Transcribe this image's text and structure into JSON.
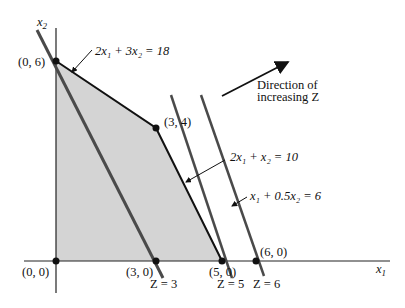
{
  "axes": {
    "x_label": "x",
    "x_sub": "1",
    "y_label": "x",
    "y_sub": "2"
  },
  "points": [
    {
      "label": "(0, 0)",
      "x": 0,
      "y": 0
    },
    {
      "label": "(0, 6)",
      "x": 0,
      "y": 6
    },
    {
      "label": "(3, 4)",
      "x": 3,
      "y": 4
    },
    {
      "label": "(3, 0)",
      "x": 3,
      "y": 0
    },
    {
      "label": "(5, 0)",
      "x": 5,
      "y": 0
    },
    {
      "label": "(6, 0)",
      "x": 6,
      "y": 0
    }
  ],
  "constraints": [
    {
      "label": "2x₁ + 3x₂ = 18"
    },
    {
      "label": "2x₁ + x₂ = 10"
    },
    {
      "label": "x₁ + 0.5x₂ = 6"
    }
  ],
  "objective_lines": [
    {
      "label": "Z = 3"
    },
    {
      "label": "Z = 5"
    },
    {
      "label": "Z = 6"
    }
  ],
  "direction": {
    "line1": "Direction of",
    "line2": "increasing Z"
  },
  "colors": {
    "feasible_fill": "#d4d4d4",
    "boundary": "#111111",
    "objective_line": "#4a4a4a",
    "axis": "#222222"
  }
}
